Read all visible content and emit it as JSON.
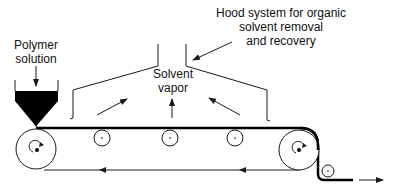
{
  "labels": {
    "polymer_line1": "Polymer",
    "polymer_line2": "solution",
    "solvent_line1": "Solvent",
    "solvent_line2": "vapor",
    "hood_line1": "Hood system for organic",
    "hood_line2": "solvent removal",
    "hood_line3": "and recovery"
  },
  "colors": {
    "stroke": "#1a1a1a",
    "fill": "#000000",
    "background": "#ffffff"
  },
  "components": {
    "hopper": "polymer-solution-hopper",
    "belt": "conveyor-belt",
    "rollers": [
      "drive-roller-left",
      "idler-roller-1",
      "idler-roller-2",
      "idler-roller-3",
      "drive-roller-right",
      "guide-roller"
    ],
    "hood": "solvent-hood"
  }
}
